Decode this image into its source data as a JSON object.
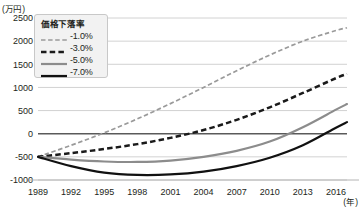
{
  "axes": {
    "y_unit": "(万円)",
    "x_unit": "(年)"
  },
  "legend": {
    "title": "価格下落率",
    "entries": [
      {
        "label": "-1.0%",
        "color": "#9a9a9a",
        "style": "fine-dash",
        "width": 1.6
      },
      {
        "label": "-3.0%",
        "color": "#1a1a1a",
        "style": "bold-dash",
        "width": 2.4
      },
      {
        "label": "-5.0%",
        "color": "#8c8c8c",
        "style": "solid",
        "width": 2.0
      },
      {
        "label": "-7.0%",
        "color": "#111111",
        "style": "solid",
        "width": 2.6
      }
    ]
  },
  "chart_data": {
    "type": "line",
    "title": "",
    "xlabel": "年",
    "ylabel": "万円",
    "grid": true,
    "legend_position": "top-left-inside",
    "xlim": [
      1989,
      2017
    ],
    "ylim": [
      -1000,
      2500
    ],
    "x_ticks": [
      1989,
      1992,
      1995,
      1998,
      2001,
      2004,
      2007,
      2010,
      2013,
      2016
    ],
    "y_ticks": [
      2500,
      2000,
      1500,
      1000,
      500,
      0,
      -500,
      -1000
    ],
    "x": [
      1989,
      1992,
      1995,
      1998,
      2001,
      2004,
      2007,
      2010,
      2013,
      2016,
      2017
    ],
    "series": [
      {
        "name": "-1.0%",
        "color": "#9a9a9a",
        "style": "fine-dash",
        "values": [
          -500,
          -250,
          20,
          320,
          650,
          1000,
          1360,
          1700,
          2000,
          2230,
          2290
        ]
      },
      {
        "name": "-3.0%",
        "color": "#1a1a1a",
        "style": "bold-dash",
        "values": [
          -500,
          -420,
          -330,
          -225,
          -90,
          80,
          300,
          570,
          880,
          1200,
          1290
        ]
      },
      {
        "name": "-5.0%",
        "color": "#8c8c8c",
        "style": "solid",
        "values": [
          -500,
          -560,
          -600,
          -610,
          -580,
          -500,
          -370,
          -170,
          140,
          520,
          640
        ]
      },
      {
        "name": "-7.0%",
        "color": "#111111",
        "style": "solid",
        "values": [
          -500,
          -700,
          -840,
          -890,
          -880,
          -820,
          -700,
          -520,
          -250,
          130,
          250
        ]
      }
    ]
  }
}
